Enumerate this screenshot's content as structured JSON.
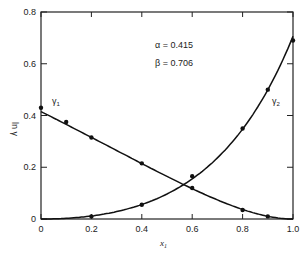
{
  "chart_data": {
    "type": "line",
    "title": "",
    "xlabel": "x1",
    "ylabel": "ln γ",
    "xlim": [
      0,
      1.0
    ],
    "ylim": [
      0,
      0.8
    ],
    "x_ticks": [
      "0",
      "0.2",
      "0.4",
      "0.6",
      "0.8",
      "1.0"
    ],
    "y_ticks": [
      "0",
      "0.2",
      "0.4",
      "0.6",
      "0.8"
    ],
    "grid": false,
    "annotations": {
      "alpha": "α = 0.415",
      "beta": "β = 0.706"
    },
    "model": {
      "alpha": 0.415,
      "beta": 0.706
    },
    "series": [
      {
        "name": "γ1",
        "label": "γ1",
        "points_x": [
          0.0,
          0.1,
          0.2,
          0.4,
          0.6,
          0.8,
          0.9
        ],
        "points_y": [
          0.43,
          0.375,
          0.315,
          0.215,
          0.12,
          0.035,
          0.01
        ]
      },
      {
        "name": "γ2",
        "label": "γ2",
        "points_x": [
          0.2,
          0.4,
          0.6,
          0.8,
          0.9,
          1.0
        ],
        "points_y": [
          0.01,
          0.055,
          0.165,
          0.35,
          0.5,
          0.69
        ]
      }
    ]
  },
  "labels": {
    "gamma1": "γ",
    "gamma1_sub": "1",
    "gamma2": "γ",
    "gamma2_sub": "2",
    "xlabel_main": "x",
    "xlabel_sub": "1",
    "ylabel": "ln γ",
    "alpha": "α = 0.415",
    "beta": "β = 0.706"
  },
  "colors": {
    "line": "#111111",
    "text": "#222222",
    "background": "#ffffff"
  }
}
